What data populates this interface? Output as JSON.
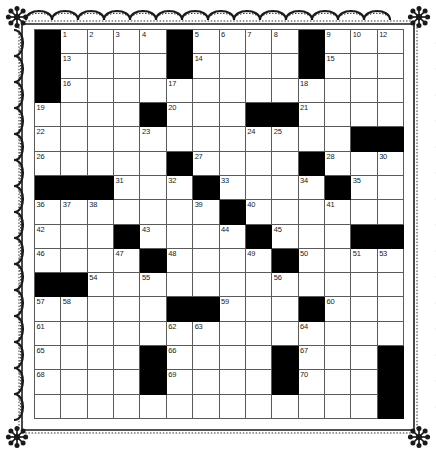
{
  "puzzle": {
    "kind": "crossword-grid",
    "columns": 14,
    "rows": 16,
    "colors": {
      "block": "#000000",
      "cell": "#ffffff",
      "grid_line": "#5a5a5a",
      "number": "#1a1a1a",
      "border_decoration": "#1a1a1a",
      "page_background": "#ffffff"
    },
    "border_decoration": "scalloped-rope-with-floral-corners",
    "number_range": {
      "first": 1,
      "last": 70
    },
    "grid": [
      [
        {
          "type": "block"
        },
        {
          "type": "cell",
          "number": "1"
        },
        {
          "type": "cell",
          "number": "2"
        },
        {
          "type": "cell",
          "number": "3"
        },
        {
          "type": "cell",
          "number": "4"
        },
        {
          "type": "block"
        },
        {
          "type": "cell",
          "number": "5"
        },
        {
          "type": "cell",
          "number": "6"
        },
        {
          "type": "cell",
          "number": "7"
        },
        {
          "type": "cell",
          "number": "8"
        },
        {
          "type": "block"
        },
        {
          "type": "cell",
          "number": "9"
        },
        {
          "type": "cell",
          "number": "10"
        },
        {
          "type": "cell",
          "number": "11"
        }
      ],
      [
        {
          "type": "block"
        },
        {
          "type": "cell",
          "number": "13"
        },
        {
          "type": "cell"
        },
        {
          "type": "cell"
        },
        {
          "type": "cell"
        },
        {
          "type": "block"
        },
        {
          "type": "cell",
          "number": "14"
        },
        {
          "type": "cell"
        },
        {
          "type": "cell"
        },
        {
          "type": "cell"
        },
        {
          "type": "block"
        },
        {
          "type": "cell",
          "number": "15"
        },
        {
          "type": "cell"
        },
        {
          "type": "cell"
        }
      ],
      [
        {
          "type": "block"
        },
        {
          "type": "cell",
          "number": "16"
        },
        {
          "type": "cell"
        },
        {
          "type": "cell"
        },
        {
          "type": "cell"
        },
        {
          "type": "cell",
          "number": "17"
        },
        {
          "type": "cell"
        },
        {
          "type": "cell"
        },
        {
          "type": "cell"
        },
        {
          "type": "cell"
        },
        {
          "type": "cell",
          "number": "18"
        },
        {
          "type": "cell"
        },
        {
          "type": "cell"
        },
        {
          "type": "cell"
        }
      ],
      [
        {
          "type": "cell",
          "number": "19"
        },
        {
          "type": "cell"
        },
        {
          "type": "cell"
        },
        {
          "type": "cell"
        },
        {
          "type": "block"
        },
        {
          "type": "cell",
          "number": "20"
        },
        {
          "type": "cell"
        },
        {
          "type": "cell"
        },
        {
          "type": "block"
        },
        {
          "type": "block"
        },
        {
          "type": "cell",
          "number": "21"
        },
        {
          "type": "cell"
        },
        {
          "type": "cell"
        },
        {
          "type": "cell"
        }
      ],
      [
        {
          "type": "cell",
          "number": "22"
        },
        {
          "type": "cell"
        },
        {
          "type": "cell"
        },
        {
          "type": "cell"
        },
        {
          "type": "cell",
          "number": "23"
        },
        {
          "type": "cell"
        },
        {
          "type": "cell"
        },
        {
          "type": "cell"
        },
        {
          "type": "cell",
          "number": "24"
        },
        {
          "type": "cell",
          "number": "25"
        },
        {
          "type": "cell"
        },
        {
          "type": "cell"
        },
        {
          "type": "block"
        },
        {
          "type": "block"
        }
      ],
      [
        {
          "type": "cell",
          "number": "26"
        },
        {
          "type": "cell"
        },
        {
          "type": "cell"
        },
        {
          "type": "cell"
        },
        {
          "type": "cell"
        },
        {
          "type": "block"
        },
        {
          "type": "cell",
          "number": "27"
        },
        {
          "type": "cell"
        },
        {
          "type": "cell"
        },
        {
          "type": "cell"
        },
        {
          "type": "block"
        },
        {
          "type": "cell",
          "number": "28"
        },
        {
          "type": "cell"
        },
        {
          "type": "cell",
          "number": "29"
        }
      ],
      [
        {
          "type": "block"
        },
        {
          "type": "block"
        },
        {
          "type": "block"
        },
        {
          "type": "cell",
          "number": "31"
        },
        {
          "type": "cell"
        },
        {
          "type": "cell",
          "number": "32"
        },
        {
          "type": "block"
        },
        {
          "type": "cell",
          "number": "33"
        },
        {
          "type": "cell"
        },
        {
          "type": "cell"
        },
        {
          "type": "cell",
          "number": "34"
        },
        {
          "type": "block"
        },
        {
          "type": "cell",
          "number": "35"
        },
        {
          "type": "cell"
        }
      ],
      [
        {
          "type": "cell",
          "number": "36"
        },
        {
          "type": "cell",
          "number": "37"
        },
        {
          "type": "cell",
          "number": "38"
        },
        {
          "type": "cell"
        },
        {
          "type": "cell"
        },
        {
          "type": "cell"
        },
        {
          "type": "cell",
          "number": "39"
        },
        {
          "type": "block"
        },
        {
          "type": "cell",
          "number": "40"
        },
        {
          "type": "cell"
        },
        {
          "type": "cell"
        },
        {
          "type": "cell",
          "number": "41"
        },
        {
          "type": "cell"
        },
        {
          "type": "cell"
        }
      ],
      [
        {
          "type": "cell",
          "number": "42"
        },
        {
          "type": "cell"
        },
        {
          "type": "cell"
        },
        {
          "type": "block"
        },
        {
          "type": "cell",
          "number": "43"
        },
        {
          "type": "cell"
        },
        {
          "type": "cell"
        },
        {
          "type": "cell",
          "number": "44"
        },
        {
          "type": "block"
        },
        {
          "type": "cell",
          "number": "45"
        },
        {
          "type": "cell"
        },
        {
          "type": "cell"
        },
        {
          "type": "block"
        },
        {
          "type": "block"
        }
      ],
      [
        {
          "type": "cell",
          "number": "46"
        },
        {
          "type": "cell"
        },
        {
          "type": "cell"
        },
        {
          "type": "cell",
          "number": "47"
        },
        {
          "type": "block"
        },
        {
          "type": "cell",
          "number": "48"
        },
        {
          "type": "cell"
        },
        {
          "type": "cell"
        },
        {
          "type": "cell",
          "number": "49"
        },
        {
          "type": "block"
        },
        {
          "type": "cell",
          "number": "50"
        },
        {
          "type": "cell"
        },
        {
          "type": "cell",
          "number": "51"
        },
        {
          "type": "cell",
          "number": "52"
        }
      ],
      [
        {
          "type": "block"
        },
        {
          "type": "block"
        },
        {
          "type": "cell",
          "number": "54"
        },
        {
          "type": "cell"
        },
        {
          "type": "cell",
          "number": "55"
        },
        {
          "type": "cell"
        },
        {
          "type": "cell"
        },
        {
          "type": "cell"
        },
        {
          "type": "cell"
        },
        {
          "type": "cell",
          "number": "56"
        },
        {
          "type": "cell"
        },
        {
          "type": "cell"
        },
        {
          "type": "cell"
        },
        {
          "type": "cell"
        }
      ],
      [
        {
          "type": "cell",
          "number": "57"
        },
        {
          "type": "cell",
          "number": "58"
        },
        {
          "type": "cell"
        },
        {
          "type": "cell"
        },
        {
          "type": "cell"
        },
        {
          "type": "block"
        },
        {
          "type": "block"
        },
        {
          "type": "cell",
          "number": "59"
        },
        {
          "type": "cell"
        },
        {
          "type": "cell"
        },
        {
          "type": "block"
        },
        {
          "type": "cell",
          "number": "60"
        },
        {
          "type": "cell"
        },
        {
          "type": "cell"
        }
      ],
      [
        {
          "type": "cell",
          "number": "61"
        },
        {
          "type": "cell"
        },
        {
          "type": "cell"
        },
        {
          "type": "cell"
        },
        {
          "type": "cell"
        },
        {
          "type": "cell",
          "number": "62"
        },
        {
          "type": "cell",
          "number": "63"
        },
        {
          "type": "cell"
        },
        {
          "type": "cell"
        },
        {
          "type": "cell"
        },
        {
          "type": "cell",
          "number": "64"
        },
        {
          "type": "cell"
        },
        {
          "type": "cell"
        },
        {
          "type": "cell"
        }
      ],
      [
        {
          "type": "cell",
          "number": "65"
        },
        {
          "type": "cell"
        },
        {
          "type": "cell"
        },
        {
          "type": "cell"
        },
        {
          "type": "block"
        },
        {
          "type": "cell",
          "number": "66"
        },
        {
          "type": "cell"
        },
        {
          "type": "cell"
        },
        {
          "type": "cell"
        },
        {
          "type": "block"
        },
        {
          "type": "cell",
          "number": "67"
        },
        {
          "type": "cell"
        },
        {
          "type": "cell"
        },
        {
          "type": "cell"
        }
      ],
      [
        {
          "type": "cell",
          "number": "68"
        },
        {
          "type": "cell"
        },
        {
          "type": "cell"
        },
        {
          "type": "cell"
        },
        {
          "type": "block"
        },
        {
          "type": "cell",
          "number": "69"
        },
        {
          "type": "cell"
        },
        {
          "type": "cell"
        },
        {
          "type": "cell"
        },
        {
          "type": "block"
        },
        {
          "type": "cell",
          "number": "70"
        },
        {
          "type": "cell"
        },
        {
          "type": "cell"
        },
        {
          "type": "cell"
        }
      ]
    ],
    "extra_right_column": {
      "note": "rightmost (14th) column entries by row",
      "rows": [
        {
          "type": "cell",
          "number": "12"
        },
        {
          "type": "cell"
        },
        {
          "type": "cell"
        },
        {
          "type": "cell"
        },
        {
          "type": "block"
        },
        {
          "type": "cell",
          "number": "30"
        },
        {
          "type": "cell"
        },
        {
          "type": "cell"
        },
        {
          "type": "block"
        },
        {
          "type": "cell",
          "number": "53"
        },
        {
          "type": "cell"
        },
        {
          "type": "cell"
        },
        {
          "type": "cell"
        },
        {
          "type": "block"
        },
        {
          "type": "block"
        },
        {
          "type": "block"
        }
      ]
    }
  }
}
